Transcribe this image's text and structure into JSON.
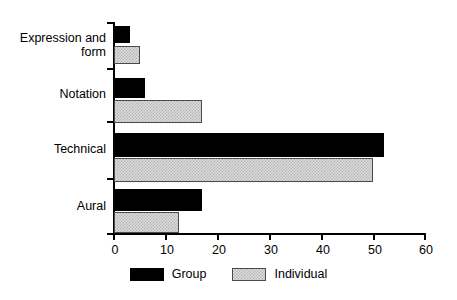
{
  "chart_data": {
    "type": "bar",
    "orientation": "horizontal",
    "title": "",
    "subtitle": "",
    "xlabel": "",
    "ylabel": "",
    "categories": [
      "Expression and\nform",
      "Notation",
      "Technical",
      "Aural"
    ],
    "series": [
      {
        "name": "Group",
        "color": "#000000",
        "values": [
          3,
          6,
          52,
          17
        ]
      },
      {
        "name": "Individual",
        "color": "#d0d0d0",
        "values": [
          5,
          17,
          50,
          12.5
        ]
      }
    ],
    "xlim": [
      0,
      60
    ],
    "xticks": [
      0,
      10,
      20,
      30,
      40,
      50,
      60
    ],
    "xticklabels": [
      "0",
      "10",
      "20",
      "30",
      "40",
      "50",
      "60"
    ],
    "grid": false,
    "legend": {
      "position": "bottom-center",
      "entries": [
        {
          "label": "Group",
          "swatch": "black-solid"
        },
        {
          "label": "Individual",
          "swatch": "gray-stippled"
        }
      ]
    },
    "axis_colors": {
      "line": "#000000",
      "text": "#000000",
      "background": "#ffffff"
    }
  }
}
